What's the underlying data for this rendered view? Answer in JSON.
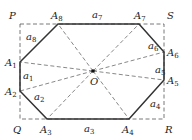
{
  "diagram": {
    "type": "octagon-in-rectangle",
    "rectangle": {
      "corners": [
        {
          "name": "P",
          "x": 20,
          "y": 24,
          "lx": 9,
          "ly": 19
        },
        {
          "name": "S",
          "x": 164,
          "y": 24,
          "lx": 167,
          "ly": 19
        },
        {
          "name": "R",
          "x": 164,
          "y": 119,
          "lx": 165,
          "ly": 133
        },
        {
          "name": "Q",
          "x": 20,
          "y": 119,
          "lx": 13,
          "ly": 133
        }
      ]
    },
    "vertices": [
      {
        "name": "A",
        "sub": "1",
        "x": 20,
        "y": 62,
        "lx": 5,
        "ly": 66
      },
      {
        "name": "A",
        "sub": "2",
        "x": 20,
        "y": 91,
        "lx": 5,
        "ly": 95
      },
      {
        "name": "A",
        "sub": "3",
        "x": 47,
        "y": 119,
        "lx": 40,
        "ly": 133
      },
      {
        "name": "A",
        "sub": "4",
        "x": 129,
        "y": 119,
        "lx": 122,
        "ly": 133
      },
      {
        "name": "A",
        "sub": "5",
        "x": 164,
        "y": 80,
        "lx": 167,
        "ly": 84
      },
      {
        "name": "A",
        "sub": "6",
        "x": 164,
        "y": 52,
        "lx": 167,
        "ly": 56
      },
      {
        "name": "A",
        "sub": "7",
        "x": 139,
        "y": 24,
        "lx": 134,
        "ly": 19
      },
      {
        "name": "A",
        "sub": "8",
        "x": 58,
        "y": 24,
        "lx": 51,
        "ly": 19
      }
    ],
    "sides": [
      {
        "name": "a",
        "sub": "1",
        "lx": 23,
        "ly": 79
      },
      {
        "name": "a",
        "sub": "2",
        "lx": 34,
        "ly": 100
      },
      {
        "name": "a",
        "sub": "3",
        "lx": 84,
        "ly": 132
      },
      {
        "name": "a",
        "sub": "4",
        "lx": 150,
        "ly": 107
      },
      {
        "name": "a",
        "sub": "5",
        "lx": 155,
        "ly": 73
      },
      {
        "name": "a",
        "sub": "6",
        "lx": 148,
        "ly": 49
      },
      {
        "name": "a",
        "sub": "7",
        "lx": 92,
        "ly": 18
      },
      {
        "name": "a",
        "sub": "8",
        "lx": 26,
        "ly": 40
      }
    ],
    "center": {
      "name": "O",
      "x": 93,
      "y": 71,
      "lx": 90,
      "ly": 85
    },
    "colors": {
      "solid": "#333333",
      "dashed": "#555555",
      "text": "#222222"
    }
  }
}
